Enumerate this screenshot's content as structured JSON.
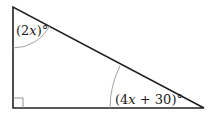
{
  "diagram": {
    "type": "right-triangle",
    "vertices": {
      "top_left": [
        13,
        7
      ],
      "bottom_left": [
        13,
        108
      ],
      "bottom_right": [
        204,
        108
      ]
    },
    "right_angle_at": "bottom_left",
    "angles": [
      {
        "vertex": "top_left",
        "label_prefix": "(2",
        "label_var": "x",
        "label_suffix": ")°",
        "full": "(2x)°"
      },
      {
        "vertex": "bottom_right",
        "label_prefix": "(4",
        "label_var": "x",
        "label_suffix": " + 30)°",
        "full": "(4x + 30)°"
      }
    ],
    "stroke_color": "#222222",
    "arc_color": "#999999"
  }
}
